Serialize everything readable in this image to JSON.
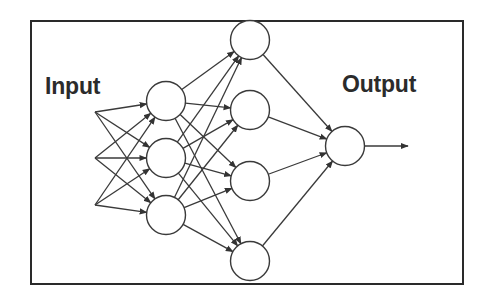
{
  "diagram": {
    "type": "feedforward-neural-network",
    "labels": {
      "input": "Input",
      "output": "Output"
    },
    "layers": [
      {
        "name": "input-sources",
        "count": 3
      },
      {
        "name": "hidden-1",
        "count": 3
      },
      {
        "name": "hidden-2",
        "count": 4
      },
      {
        "name": "output",
        "count": 1
      }
    ],
    "colors": {
      "stroke": "#3a3a3a",
      "border": "#2a2a2a",
      "node_fill": "#ffffff",
      "background": "#ffffff"
    }
  }
}
